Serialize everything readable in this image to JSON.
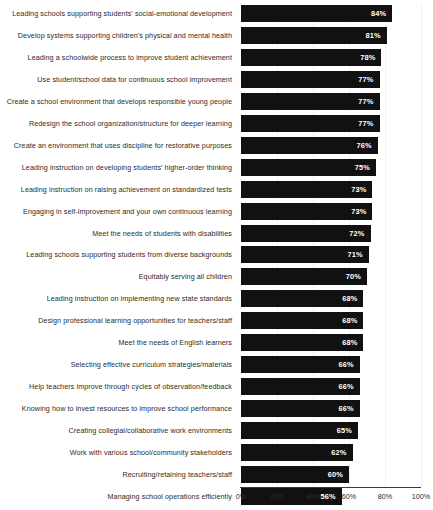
{
  "chart_data": {
    "type": "bar",
    "orientation": "horizontal",
    "title": "",
    "subtitle": "",
    "xlabel": "",
    "ylabel": "",
    "xlim": [
      0,
      100
    ],
    "grid": true,
    "grid_axis": "x",
    "legend": "none",
    "value_format": "percent",
    "bar_color": "#111111",
    "value_label_color": "#ffffff",
    "category_label_color": "#2b2b2b",
    "axis_color": "#3a3a3a",
    "gridline_color": "#f0f0f0",
    "background_color": "#ffffff",
    "xticks": [
      0,
      20,
      40,
      60,
      80,
      100
    ],
    "xtick_labels": [
      "0%",
      "20%",
      "40%",
      "60%",
      "80%",
      "100%"
    ],
    "categories": [
      "Leading schools supporting students' social-emotional development",
      "Develop systems supporting children's physical and mental health",
      "Leading a schoolwide process to improve student achievement",
      "Use student/school data for continuous school improvement",
      "Create a school environment that develops responsible young people",
      "Redesign the school organization/structure for deeper learning",
      "Create an environment that uses discipline for restorative purposes",
      "Leading instruction on developing students' higher-order thinking",
      "Leading instruction on raising achievement on standardized tests",
      "Engaging in self-improvement and your own continuous learning",
      "Meet the needs of students with disabilities",
      "Leading schools supporting students from diverse backgrounds",
      "Equitably serving all children",
      "Leading instruction on implementing new state standards",
      "Design professional learning opportunities for teachers/staff",
      "Meet the needs of English learners",
      "Selecting effective curriculum strategies/materials",
      "Help teachers improve through cycles of observation/feedback",
      "Knowing how to invest resources to improve school performance",
      "Creating collegial/collaborative work environments",
      "Work with various school/community stakeholders",
      "Recruiting/retaining teachers/staff",
      "Managing school operations efficiently"
    ],
    "values": [
      84,
      81,
      78,
      77,
      77,
      77,
      76,
      75,
      73,
      73,
      72,
      71,
      70,
      68,
      68,
      68,
      66,
      66,
      66,
      65,
      62,
      60,
      56
    ],
    "value_labels": [
      "84%",
      "81%",
      "78%",
      "77%",
      "77%",
      "77%",
      "76%",
      "75%",
      "73%",
      "73%",
      "72%",
      "71%",
      "70%",
      "68%",
      "68%",
      "68%",
      "66%",
      "66%",
      "66%",
      "65%",
      "62%",
      "60%",
      "56%"
    ]
  }
}
